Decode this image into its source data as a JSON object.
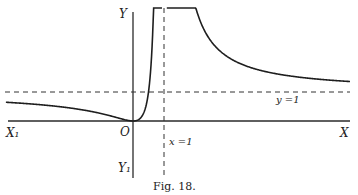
{
  "figure": {
    "caption": "Fig. 18.",
    "labels": {
      "x_pos": "X",
      "x_neg": "X₁",
      "y_pos": "Y",
      "y_neg": "Y₁",
      "origin": "O",
      "vertical_asymptote": "x =1",
      "horizontal_asymptote": "y =1"
    }
  },
  "chart_data": {
    "type": "line",
    "title": "Fig. 18.",
    "xlabel": "X",
    "ylabel": "Y",
    "xlim": [
      -2.6,
      4.5
    ],
    "ylim": [
      -0.55,
      3.2
    ],
    "asymptotes": {
      "vertical_x": 1,
      "horizontal_y": 1
    },
    "series": [
      {
        "name": "curve-left-branch",
        "description": "y = x^2/(x-1)^2 for x < 1, touching origin",
        "x": [
          -2.6,
          -2,
          -1.5,
          -1,
          -0.5,
          -0.2,
          0,
          0.2,
          0.4,
          0.5,
          0.6,
          0.7,
          0.8,
          0.85
        ],
        "y": [
          0.52,
          0.44,
          0.36,
          0.25,
          0.11,
          0.03,
          0,
          0.06,
          0.44,
          1.0,
          2.25,
          5.4,
          16,
          32
        ]
      },
      {
        "name": "curve-right-branch",
        "description": "y = x^2/(x-1)^2 for x > 1, approaching y=1",
        "x": [
          1.12,
          1.2,
          1.3,
          1.5,
          1.8,
          2.2,
          2.8,
          3.5,
          4.5
        ],
        "y": [
          87,
          36,
          18.8,
          9,
          5.06,
          3.36,
          2.42,
          1.96,
          1.65
        ]
      }
    ]
  }
}
